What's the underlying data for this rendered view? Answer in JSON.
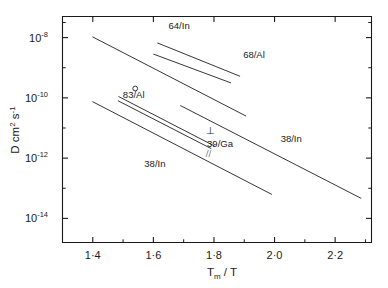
{
  "chart_data": {
    "type": "line",
    "title": "",
    "xlabel": "T_m / T",
    "ylabel": "D / cm^2 s^-1",
    "xlabel_main": "T",
    "xlabel_sub": "m",
    "xlabel_rest": "/ T",
    "ylabel_D": "D",
    "ylabel_units_pre": "cm",
    "ylabel_units_sup1": "2",
    "ylabel_units_mid": "s",
    "ylabel_units_sup2": "-1",
    "xlim": [
      1.3,
      2.32
    ],
    "ylim_log10": [
      -14.8,
      -7.3
    ],
    "grid": false,
    "legend": "inline-annotations",
    "xticks": [
      "1·4",
      "1·6",
      "1·8",
      "2·0",
      "2·2"
    ],
    "xtick_values": [
      1.4,
      1.6,
      1.8,
      2.0,
      2.2
    ],
    "xminor_values": [
      1.5,
      1.7,
      1.9,
      2.1,
      2.3
    ],
    "yticks_mantissa": [
      "10",
      "10",
      "10",
      "10"
    ],
    "yticks_exponent": [
      "-8",
      "-10",
      "-12",
      "-14"
    ],
    "ytick_log10": [
      -8,
      -10,
      -12,
      -14
    ],
    "yminor_log10": [
      -7.5,
      -9,
      -11,
      -13
    ],
    "series": [
      {
        "name": "64/In",
        "label": "64/In",
        "label_x": 1.685,
        "label_y_log10": -7.72,
        "points": [
          [
            1.614,
            -8.18
          ],
          [
            1.885,
            -9.28
          ]
        ]
      },
      {
        "name": "68/Al",
        "label": "68/Al",
        "label_x": 1.932,
        "label_y_log10": -8.68,
        "points": [
          [
            1.601,
            -8.55
          ],
          [
            1.855,
            -9.5
          ]
        ]
      },
      {
        "name": "83/Al",
        "label": "83/Al",
        "label_x": 1.535,
        "label_y_log10": -9.99,
        "marker": {
          "x": 1.54,
          "y_log10": -9.69,
          "shape": "circle-open"
        },
        "points": [
          [
            1.4,
            -7.98
          ],
          [
            1.905,
            -10.6
          ]
        ]
      },
      {
        "name": "39/Ga perpendicular",
        "label": "⊥",
        "label_x": 1.79,
        "label_y_log10": -11.21,
        "points": [
          [
            1.486,
            -9.96
          ],
          [
            1.8,
            -11.59
          ]
        ]
      },
      {
        "name": "39/Ga parallel",
        "label": "//",
        "label_x": 1.782,
        "label_y_log10": -11.95,
        "points": [
          [
            1.484,
            -10.1
          ],
          [
            1.79,
            -11.68
          ]
        ]
      },
      {
        "name": "39/Ga",
        "label": "39/Ga",
        "label_x": 1.82,
        "label_y_log10": -11.63,
        "points": []
      },
      {
        "name": "38/In lower",
        "label": "38/In",
        "label_x": 1.605,
        "label_y_log10": -12.28,
        "points": [
          [
            1.4,
            -10.13
          ],
          [
            1.99,
            -13.2
          ]
        ]
      },
      {
        "name": "38/In upper",
        "label": "38/In",
        "label_x": 2.055,
        "label_y_log10": -11.48,
        "points": [
          [
            1.69,
            -10.26
          ],
          [
            2.285,
            -13.33
          ]
        ]
      }
    ]
  }
}
